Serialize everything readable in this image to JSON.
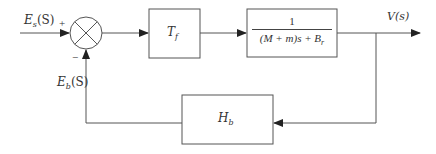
{
  "diagram": {
    "type": "feedback_control_block_diagram",
    "colors": {
      "line": "#555555",
      "text": "#333333",
      "background": "#ffffff"
    },
    "input": {
      "label": "E",
      "label_sub": "s",
      "label_arg": "(S)"
    },
    "summing_junction": {
      "plus_sign": "+",
      "minus_sign": "−"
    },
    "forward_blocks": [
      {
        "id": "Tf",
        "label": "T",
        "label_sub": "f"
      },
      {
        "id": "plant",
        "numerator": "1",
        "denominator": "(M + m)s + B",
        "denominator_sub": "r"
      }
    ],
    "output": {
      "label": "V(s)"
    },
    "feedback_block": {
      "id": "Hb",
      "label": "H",
      "label_sub": "b"
    },
    "feedback_signal": {
      "label": "E",
      "label_sub": "b",
      "label_arg": "(S)"
    }
  }
}
